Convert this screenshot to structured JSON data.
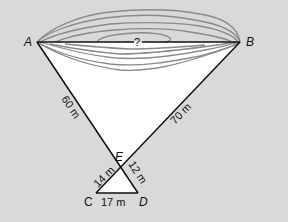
{
  "diagram": {
    "points": {
      "A": {
        "label": "A",
        "x": 37,
        "y": 42
      },
      "B": {
        "label": "B",
        "x": 240,
        "y": 42
      },
      "C": {
        "label": "C",
        "x": 96,
        "y": 193
      },
      "D": {
        "label": "D",
        "x": 138,
        "y": 193
      },
      "E": {
        "label": "E",
        "x": 121,
        "y": 168
      }
    },
    "segments": [
      {
        "from": "A",
        "to": "B",
        "label": "?"
      },
      {
        "from": "A",
        "to": "E",
        "label": "60 m"
      },
      {
        "from": "B",
        "to": "E",
        "label": "70 m"
      },
      {
        "from": "E",
        "to": "C",
        "label": "14 m"
      },
      {
        "from": "E",
        "to": "D",
        "label": "12 m"
      },
      {
        "from": "C",
        "to": "D",
        "label": "17 m"
      }
    ],
    "unknown_label": "?",
    "colors": {
      "background": "#d9d9d9",
      "triangle_fill": "#ffffff",
      "line": "#111111",
      "contour": "#8a8a8a"
    }
  }
}
